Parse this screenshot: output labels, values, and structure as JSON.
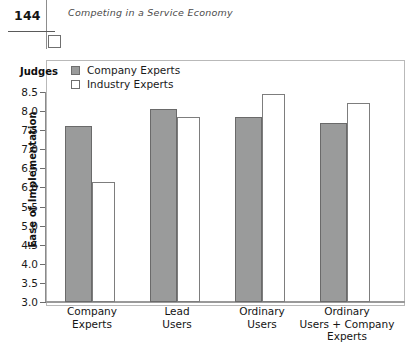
{
  "page": {
    "number": "144",
    "running_head": "Competing in a Service Economy"
  },
  "chart_data": {
    "type": "bar",
    "title": "",
    "xlabel": "",
    "ylabel": "Ease of Implementation",
    "ylim": [
      3.0,
      8.5
    ],
    "ytick_labels": [
      "8.5",
      "8.0",
      "7.5",
      "7.0",
      "6.5",
      "6.0",
      "5.5",
      "5.0",
      "4.5",
      "4.0",
      "3.5",
      "3.0"
    ],
    "ytick_values": [
      8.5,
      8.0,
      7.5,
      7.0,
      6.5,
      6.0,
      5.5,
      5.0,
      4.5,
      4.0,
      3.5,
      3.0
    ],
    "grid": false,
    "legend_title": "Judges",
    "legend_position": "top-left-inside",
    "categories": [
      "Company\nExperts",
      "Lead\nUsers",
      "Ordinary\nUsers",
      "Ordinary\nUsers + Company\nExperts"
    ],
    "category_lines": [
      [
        "Company",
        "Experts"
      ],
      [
        "Lead",
        "Users"
      ],
      [
        "Ordinary",
        "Users"
      ],
      [
        "Ordinary",
        "Users + Company",
        "Experts"
      ]
    ],
    "series": [
      {
        "name": "Company Experts",
        "color": "#9a9b9b",
        "edge_color": "#6a6a6a",
        "values": [
          7.6,
          8.05,
          7.85,
          7.7
        ]
      },
      {
        "name": "Industry Experts",
        "color": "#ffffff",
        "edge_color": "#7d7d7d",
        "values": [
          6.15,
          7.85,
          8.45,
          8.2
        ]
      }
    ]
  },
  "colors": {
    "company_experts_fill": "#9a9b9b",
    "industry_experts_fill": "#ffffff",
    "axis": "#8a8a8a",
    "frame": "#b9b9b9",
    "text": "#1a1a1a"
  }
}
